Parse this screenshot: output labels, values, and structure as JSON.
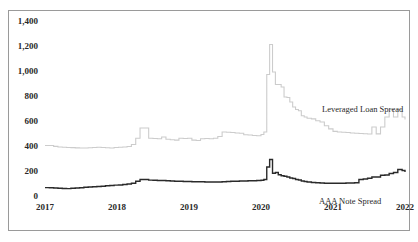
{
  "chart_data": {
    "type": "line",
    "title": "",
    "subtitle": "",
    "xlabel": "",
    "ylabel": "",
    "xlim": [
      2017.0,
      2022.0
    ],
    "ylim": [
      0,
      1400
    ],
    "grid": false,
    "legend_position": "inline-annotations",
    "x_tick_labels": [
      "2017",
      "2018",
      "2019",
      "2020",
      "2021",
      "2022"
    ],
    "x_tick_values": [
      2017,
      2018,
      2019,
      2020,
      2021,
      2022
    ],
    "y_tick_labels": [
      "0",
      "200",
      "400",
      "600",
      "800",
      "1,000",
      "1,200",
      "1,400"
    ],
    "y_tick_values": [
      0,
      200,
      400,
      600,
      800,
      1000,
      1200,
      1400
    ],
    "annotations": [
      {
        "text": "Leveraged Loan Spread",
        "x": 2021.05,
        "y": 700
      },
      {
        "text": "AAA Note Spread",
        "x": 2021.2,
        "y": 60
      }
    ],
    "series": [
      {
        "name": "Leveraged Loan Spread",
        "color": "#cccccc",
        "width": 1.1,
        "x": [
          2017.0,
          2017.06,
          2017.12,
          2017.18,
          2017.24,
          2017.3,
          2017.36,
          2017.42,
          2017.48,
          2017.54,
          2017.6,
          2017.66,
          2017.72,
          2017.78,
          2017.84,
          2017.9,
          2017.96,
          2018.02,
          2018.08,
          2018.14,
          2018.2,
          2018.26,
          2018.32,
          2018.38,
          2018.44,
          2018.5,
          2018.56,
          2018.62,
          2018.68,
          2018.74,
          2018.8,
          2018.86,
          2018.92,
          2018.98,
          2019.04,
          2019.1,
          2019.16,
          2019.22,
          2019.28,
          2019.34,
          2019.4,
          2019.46,
          2019.52,
          2019.58,
          2019.64,
          2019.7,
          2019.76,
          2019.82,
          2019.88,
          2019.94,
          2020.0,
          2020.04,
          2020.08,
          2020.12,
          2020.16,
          2020.2,
          2020.24,
          2020.28,
          2020.32,
          2020.36,
          2020.4,
          2020.44,
          2020.48,
          2020.52,
          2020.56,
          2020.6,
          2020.64,
          2020.7,
          2020.76,
          2020.82,
          2020.88,
          2020.94,
          2021.0,
          2021.06,
          2021.12,
          2021.18,
          2021.24,
          2021.3,
          2021.36,
          2021.42,
          2021.48,
          2021.54,
          2021.6,
          2021.66,
          2021.72,
          2021.78,
          2021.84,
          2021.9,
          2021.96,
          2022.0
        ],
        "values": [
          412,
          412,
          405,
          400,
          398,
          396,
          395,
          393,
          392,
          392,
          394,
          396,
          398,
          396,
          394,
          392,
          396,
          398,
          400,
          404,
          420,
          470,
          552,
          552,
          470,
          468,
          466,
          480,
          462,
          458,
          455,
          470,
          468,
          470,
          455,
          452,
          466,
          468,
          466,
          470,
          484,
          520,
          518,
          516,
          512,
          510,
          498,
          496,
          492,
          490,
          500,
          520,
          980,
          1220,
          1000,
          900,
          900,
          880,
          800,
          796,
          760,
          720,
          700,
          690,
          650,
          640,
          630,
          625,
          610,
          600,
          570,
          545,
          525,
          520,
          518,
          516,
          512,
          510,
          508,
          506,
          504,
          560,
          505,
          560,
          640,
          700,
          640,
          700,
          640,
          620
        ]
      },
      {
        "name": "AAA Note Spread",
        "color": "#2a2a2a",
        "width": 1.4,
        "x": [
          2017.0,
          2017.06,
          2017.12,
          2017.18,
          2017.24,
          2017.3,
          2017.36,
          2017.42,
          2017.48,
          2017.54,
          2017.6,
          2017.66,
          2017.72,
          2017.78,
          2017.84,
          2017.9,
          2017.96,
          2018.02,
          2018.08,
          2018.14,
          2018.2,
          2018.26,
          2018.32,
          2018.38,
          2018.44,
          2018.5,
          2018.56,
          2018.62,
          2018.68,
          2018.74,
          2018.8,
          2018.86,
          2018.92,
          2018.98,
          2019.04,
          2019.1,
          2019.16,
          2019.22,
          2019.28,
          2019.34,
          2019.4,
          2019.46,
          2019.52,
          2019.58,
          2019.64,
          2019.7,
          2019.76,
          2019.82,
          2019.88,
          2019.94,
          2020.0,
          2020.04,
          2020.08,
          2020.12,
          2020.16,
          2020.2,
          2020.24,
          2020.28,
          2020.32,
          2020.36,
          2020.4,
          2020.44,
          2020.48,
          2020.52,
          2020.56,
          2020.6,
          2020.64,
          2020.7,
          2020.76,
          2020.82,
          2020.88,
          2020.94,
          2021.0,
          2021.06,
          2021.12,
          2021.18,
          2021.24,
          2021.3,
          2021.36,
          2021.42,
          2021.48,
          2021.54,
          2021.6,
          2021.66,
          2021.72,
          2021.78,
          2021.84,
          2021.9,
          2021.96,
          2022.0
        ],
        "values": [
          75,
          74,
          72,
          70,
          68,
          67,
          70,
          72,
          74,
          78,
          80,
          82,
          84,
          86,
          90,
          92,
          95,
          96,
          100,
          104,
          110,
          126,
          140,
          140,
          135,
          134,
          132,
          132,
          130,
          128,
          126,
          126,
          124,
          124,
          122,
          122,
          122,
          120,
          120,
          120,
          120,
          122,
          124,
          126,
          126,
          128,
          128,
          130,
          130,
          132,
          134,
          140,
          240,
          300,
          190,
          196,
          178,
          170,
          166,
          160,
          152,
          148,
          140,
          136,
          128,
          124,
          120,
          116,
          114,
          112,
          110,
          110,
          110,
          110,
          110,
          112,
          112,
          114,
          140,
          144,
          150,
          160,
          160,
          174,
          176,
          188,
          196,
          220,
          212,
          200
        ]
      }
    ]
  },
  "axes": {
    "y_labels": [
      "1,400",
      "1,200",
      "1,000",
      "800",
      "600",
      "400",
      "200",
      "0"
    ],
    "x_labels": [
      "2017",
      "2018",
      "2019",
      "2020",
      "2021",
      "2022"
    ]
  },
  "annotations": {
    "leveraged": "Leveraged  Loan  Spread",
    "aaa": "AAA  Note  Spread"
  }
}
